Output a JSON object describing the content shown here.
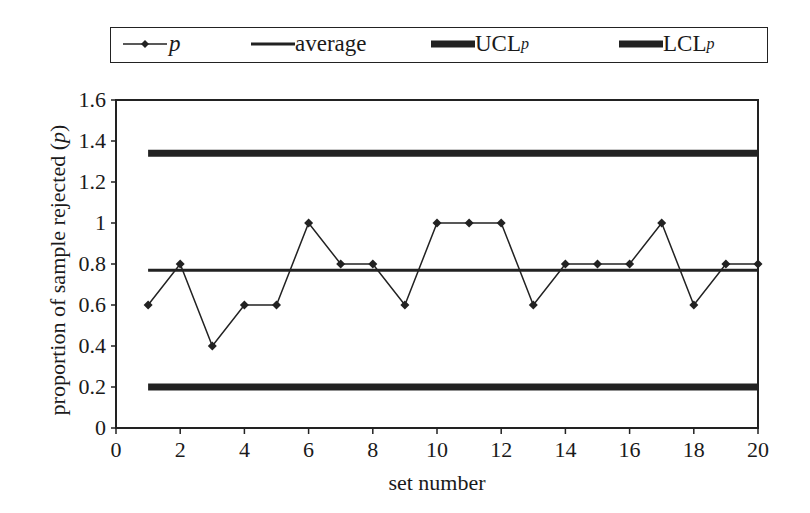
{
  "legend": {
    "items": [
      {
        "label": "p",
        "style": "line-marker"
      },
      {
        "label": "average",
        "style": "thin-line"
      },
      {
        "label": "UCL",
        "sub": "p",
        "style": "thick-line"
      },
      {
        "label": "LCL",
        "sub": "p",
        "style": "thick-line"
      }
    ]
  },
  "axes": {
    "ylabel_main": "proportion of sample rejected (",
    "ylabel_var": "p",
    "ylabel_end": ")",
    "xlabel": "set number"
  },
  "chart_data": {
    "type": "line",
    "title": "",
    "xlabel": "set number",
    "ylabel": "proportion of sample rejected (p)",
    "xlim": [
      0,
      20
    ],
    "ylim": [
      0,
      1.6
    ],
    "xticks": [
      0,
      2,
      4,
      6,
      8,
      10,
      12,
      14,
      16,
      18,
      20
    ],
    "yticks": [
      0,
      0.2,
      0.4,
      0.6,
      0.8,
      1,
      1.2,
      1.4,
      1.6
    ],
    "ytick_labels": [
      "0",
      "0.2",
      "0.4",
      "0.6",
      "0.8",
      "1",
      "1.2",
      "1.4",
      "1.6"
    ],
    "grid": false,
    "legend_position": "top",
    "x": [
      1,
      2,
      3,
      4,
      5,
      6,
      7,
      8,
      9,
      10,
      11,
      12,
      13,
      14,
      15,
      16,
      17,
      18,
      19,
      20
    ],
    "series": [
      {
        "name": "p",
        "values": [
          0.6,
          0.8,
          0.4,
          0.6,
          0.6,
          1,
          0.8,
          0.8,
          0.6,
          1,
          1,
          1,
          0.6,
          0.8,
          0.8,
          0.8,
          1,
          0.6,
          0.8,
          0.8
        ]
      },
      {
        "name": "average",
        "values": [
          0.77,
          0.77,
          0.77,
          0.77,
          0.77,
          0.77,
          0.77,
          0.77,
          0.77,
          0.77,
          0.77,
          0.77,
          0.77,
          0.77,
          0.77,
          0.77,
          0.77,
          0.77,
          0.77,
          0.77
        ]
      },
      {
        "name": "UCLp",
        "values": [
          1.34,
          1.34,
          1.34,
          1.34,
          1.34,
          1.34,
          1.34,
          1.34,
          1.34,
          1.34,
          1.34,
          1.34,
          1.34,
          1.34,
          1.34,
          1.34,
          1.34,
          1.34,
          1.34,
          1.34
        ]
      },
      {
        "name": "LCLp",
        "values": [
          0.2,
          0.2,
          0.2,
          0.2,
          0.2,
          0.2,
          0.2,
          0.2,
          0.2,
          0.2,
          0.2,
          0.2,
          0.2,
          0.2,
          0.2,
          0.2,
          0.2,
          0.2,
          0.2,
          0.2
        ]
      }
    ]
  }
}
